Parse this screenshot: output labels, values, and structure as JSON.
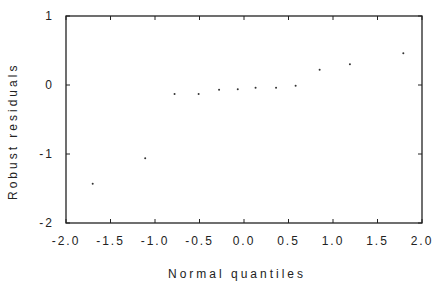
{
  "chart_data": {
    "type": "scatter",
    "title": "",
    "xlabel": "Normal quantiles",
    "ylabel": "Robust residuals",
    "xlim": [
      -2.0,
      2.0
    ],
    "ylim": [
      -2,
      1
    ],
    "xticks": [
      -2.0,
      -1.5,
      -1.0,
      -0.5,
      0.0,
      0.5,
      1.0,
      1.5,
      2.0
    ],
    "xtick_labels": [
      "-2.0",
      "-1.5",
      "-1.0",
      "-0.5",
      "0.0",
      "0.5",
      "1.0",
      "1.5",
      "2.0"
    ],
    "yticks": [
      1,
      0,
      -1,
      -2
    ],
    "ytick_labels": [
      "1",
      "0",
      "-1",
      "-2"
    ],
    "grid": false,
    "legend": null,
    "series": [
      {
        "name": "residuals",
        "x": [
          -1.7,
          -1.11,
          -0.78,
          -0.51,
          -0.28,
          -0.07,
          0.13,
          0.36,
          0.58,
          0.85,
          1.19,
          1.79
        ],
        "y": [
          -1.43,
          -1.06,
          -0.13,
          -0.13,
          -0.07,
          -0.06,
          -0.04,
          -0.04,
          -0.01,
          0.22,
          0.3,
          0.46
        ]
      }
    ]
  },
  "labels": {
    "xlabel": "Normal quantiles",
    "ylabel": "Robust residuals"
  },
  "colors": {
    "axis": "#222222",
    "points": "#333333",
    "background": "#ffffff"
  }
}
